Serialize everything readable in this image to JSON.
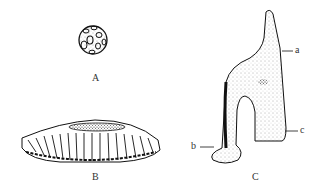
{
  "figure": {
    "panels": [
      {
        "id": "A",
        "label": "A",
        "description": "spherical colony"
      },
      {
        "id": "B",
        "label": "B",
        "description": "disc-shaped colony, side view"
      },
      {
        "id": "C",
        "label": "C",
        "description": "arch-shaped structure",
        "parts": [
          {
            "label": "a"
          },
          {
            "label": "b"
          },
          {
            "label": "c"
          }
        ]
      }
    ]
  }
}
